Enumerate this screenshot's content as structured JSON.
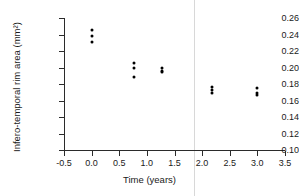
{
  "chart_data": {
    "type": "scatter",
    "title": "",
    "xlabel": "Time (years)",
    "ylabel": "Infero-temporal rim area (mm²)",
    "xlim": [
      -0.5,
      3.5
    ],
    "ylim": [
      0.1,
      0.26
    ],
    "xticks": [
      -0.5,
      0.0,
      0.5,
      1.0,
      1.5,
      2.0,
      2.5,
      3.0,
      3.5
    ],
    "xticklabels": [
      "-0.5",
      "0.0",
      "0.5",
      "1.0",
      "1.5",
      "2.0",
      "2.5",
      "3.0",
      "3.5"
    ],
    "yticks": [
      0.1,
      0.12,
      0.14,
      0.16,
      0.18,
      0.2,
      0.22,
      0.24,
      0.26
    ],
    "yticklabels": [
      "0.10",
      "0.12",
      "0.14",
      "0.16",
      "0.18",
      "0.20",
      "0.22",
      "0.24",
      "0.26"
    ],
    "grid": false,
    "legend": null,
    "marker": "filled-circle",
    "marker_color": "#000000",
    "points": [
      {
        "x": 0.0,
        "y": 0.2455
      },
      {
        "x": 0.0,
        "y": 0.238
      },
      {
        "x": 0.0,
        "y": 0.231
      },
      {
        "x": 0.76,
        "y": 0.205
      },
      {
        "x": 0.76,
        "y": 0.2
      },
      {
        "x": 0.76,
        "y": 0.188
      },
      {
        "x": 1.27,
        "y": 0.199
      },
      {
        "x": 1.27,
        "y": 0.196
      },
      {
        "x": 1.27,
        "y": 0.194
      },
      {
        "x": 2.17,
        "y": 0.176
      },
      {
        "x": 2.17,
        "y": 0.173
      },
      {
        "x": 2.17,
        "y": 0.169
      },
      {
        "x": 3.0,
        "y": 0.175
      },
      {
        "x": 3.0,
        "y": 0.169
      },
      {
        "x": 3.0,
        "y": 0.167
      }
    ],
    "annotations": [
      {
        "type": "vertical-line",
        "x": 1.85,
        "color": "#d8d8d8"
      }
    ]
  }
}
